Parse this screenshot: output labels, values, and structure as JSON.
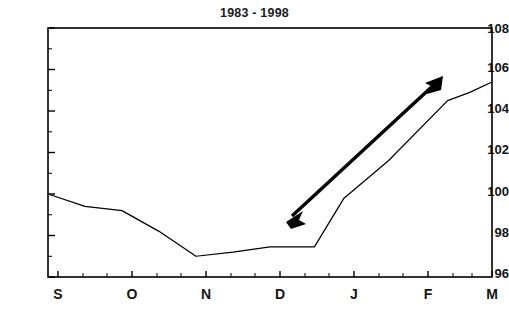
{
  "chart_data": {
    "type": "line",
    "title": "1983 - 1998",
    "xlabel": "",
    "ylabel": "",
    "ylim": [
      96,
      108
    ],
    "xlim": [
      0,
      6
    ],
    "grid": false,
    "legend": null,
    "y_ticks": [
      96,
      98,
      100,
      102,
      104,
      106,
      108
    ],
    "x_ticks": [
      "S",
      "O",
      "N",
      "D",
      "J",
      "F",
      "M"
    ],
    "categories": [
      "S",
      "O",
      "N",
      "D",
      "J",
      "F",
      "M"
    ],
    "minor_ticks_per_interval": 2,
    "series": [
      {
        "name": "index",
        "x": [
          0.0,
          0.5,
          1.0,
          1.5,
          2.0,
          2.5,
          3.0,
          3.25,
          3.6,
          4.0,
          4.6,
          5.4,
          5.7,
          6.0
        ],
        "values": [
          100.0,
          99.4,
          99.2,
          98.2,
          97.0,
          97.2,
          97.45,
          97.45,
          97.45,
          99.8,
          101.6,
          104.5,
          104.9,
          105.4
        ],
        "color": "#000000"
      }
    ],
    "annotations": [
      {
        "type": "double-arrow",
        "label": "trend-arrow",
        "from": {
          "x": 3.05,
          "y": 98.5
        },
        "to": {
          "x": 5.2,
          "y": 105.8
        },
        "color": "#000000"
      }
    ]
  },
  "axes": {
    "frame_color": "#000000",
    "tick_color": "#000000",
    "background": "#ffffff"
  }
}
